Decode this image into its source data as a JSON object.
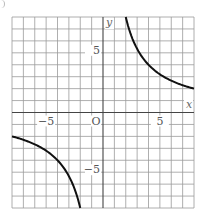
{
  "chart_data": {
    "type": "line",
    "title": "",
    "function": "y = 16/x",
    "xlabel": "x",
    "ylabel": "y",
    "origin_label": "O",
    "xlim": [
      -8,
      8
    ],
    "ylim": [
      -8,
      8
    ],
    "grid": true,
    "grid_step": 1,
    "x_ticks": [
      {
        "value": -5,
        "label": "−5"
      },
      {
        "value": 5,
        "label": "5"
      }
    ],
    "y_ticks": [
      {
        "value": 5,
        "label": "5"
      },
      {
        "value": -5,
        "label": "−5"
      }
    ],
    "series": [
      {
        "name": "branch-positive",
        "points": [
          [
            2,
            8
          ],
          [
            2.5,
            6.4
          ],
          [
            3,
            5.33
          ],
          [
            4,
            4
          ],
          [
            5,
            3.2
          ],
          [
            6,
            2.67
          ],
          [
            7,
            2.29
          ],
          [
            8,
            2
          ]
        ]
      },
      {
        "name": "branch-negative",
        "points": [
          [
            -8,
            -2
          ],
          [
            -7,
            -2.29
          ],
          [
            -6,
            -2.67
          ],
          [
            -5,
            -3.2
          ],
          [
            -4,
            -4
          ],
          [
            -3,
            -5.33
          ],
          [
            -2.5,
            -6.4
          ],
          [
            -2,
            -8
          ]
        ]
      }
    ],
    "colors": {
      "grid": "#9a9a9a",
      "axis": "#444444",
      "curve": "#111111"
    }
  }
}
